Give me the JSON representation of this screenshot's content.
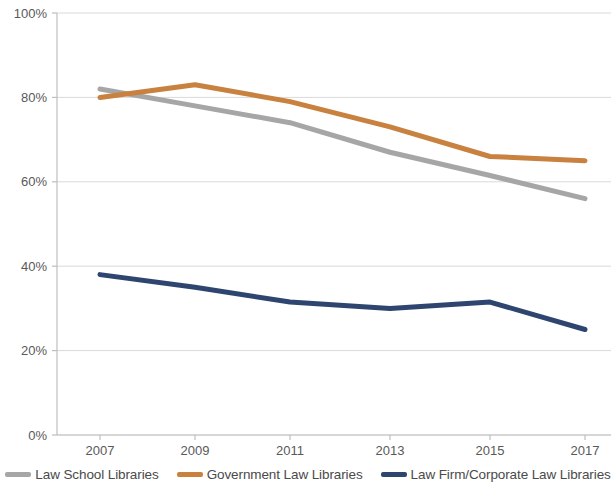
{
  "chart_data": {
    "type": "line",
    "title": "",
    "xlabel": "",
    "ylabel": "",
    "categories": [
      "2007",
      "2009",
      "2011",
      "2013",
      "2015",
      "2017"
    ],
    "ylim": [
      0,
      100
    ],
    "ytick_labels": [
      "0%",
      "20%",
      "40%",
      "60%",
      "80%",
      "100%"
    ],
    "ytick_values": [
      0,
      20,
      40,
      60,
      80,
      100
    ],
    "grid": true,
    "legend_position": "bottom",
    "series": [
      {
        "name": "Law School Libraries",
        "color": "#a6a6a6",
        "values": [
          82,
          78,
          74,
          67,
          61.5,
          56
        ]
      },
      {
        "name": "Government Law Libraries",
        "color": "#c8813f",
        "values": [
          80,
          83,
          79,
          73,
          66,
          65
        ]
      },
      {
        "name": "Law Firm/Corporate Law Libraries",
        "color": "#2e4570",
        "values": [
          38,
          35,
          31.5,
          30,
          31.5,
          25
        ]
      }
    ]
  },
  "axis": {
    "tick_color": "#bfbfbf",
    "grid_color": "#d9d9d9",
    "label_color": "#595959"
  },
  "legend": {
    "items": [
      {
        "label": "Law School Libraries",
        "color": "#a6a6a6"
      },
      {
        "label": "Government Law Libraries",
        "color": "#c8813f"
      },
      {
        "label": "Law Firm/Corporate Law Libraries",
        "color": "#2e4570"
      }
    ]
  }
}
